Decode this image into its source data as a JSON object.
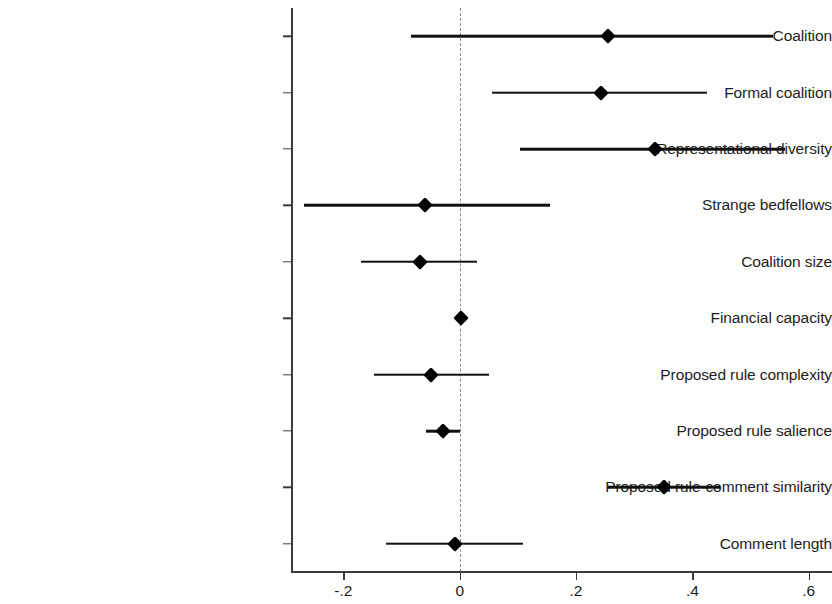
{
  "chart_data": {
    "type": "scatter",
    "subtype": "coefficient-plot",
    "title": "",
    "xlabel": "",
    "ylabel": "",
    "xlim": [
      -0.29,
      0.64
    ],
    "xticks": [
      -0.2,
      0,
      0.2,
      0.4,
      0.6
    ],
    "xtick_labels": [
      "-.2",
      "0",
      ".2",
      ".4",
      ".6"
    ],
    "grid": false,
    "legend": "none",
    "reference_line": {
      "value": 0,
      "style": "dashed",
      "color": "#8a8a8a"
    },
    "marker": {
      "shape": "diamond",
      "color": "#000000"
    },
    "ci_line_color": "#111111",
    "categories": [
      "Coalition",
      "Formal coalition",
      "Representational diversity",
      "Strange bedfellows",
      "Coalition size",
      "Financial capacity",
      "Proposed rule complexity",
      "Proposed rule salience",
      "Proposed rule-comment similarity",
      "Comment length"
    ],
    "points": [
      {
        "label": "Coalition",
        "estimate": 0.255,
        "ci_low": -0.084,
        "ci_high": 0.538
      },
      {
        "label": "Formal coalition",
        "estimate": 0.243,
        "ci_low": 0.055,
        "ci_high": 0.425
      },
      {
        "label": "Representational diversity",
        "estimate": 0.336,
        "ci_low": 0.104,
        "ci_high": 0.56
      },
      {
        "label": "Strange bedfellows",
        "estimate": -0.06,
        "ci_low": -0.267,
        "ci_high": 0.155
      },
      {
        "label": "Coalition size",
        "estimate": -0.069,
        "ci_low": -0.17,
        "ci_high": 0.03
      },
      {
        "label": "Financial capacity",
        "estimate": 0.002,
        "ci_low": -0.008,
        "ci_high": 0.012
      },
      {
        "label": "Proposed rule complexity",
        "estimate": -0.05,
        "ci_low": -0.147,
        "ci_high": 0.05
      },
      {
        "label": "Proposed rule salience",
        "estimate": -0.029,
        "ci_low": -0.058,
        "ci_high": 0.001
      },
      {
        "label": "Proposed rule-comment similarity",
        "estimate": 0.352,
        "ci_low": 0.255,
        "ci_high": 0.448
      },
      {
        "label": "Comment length",
        "estimate": -0.008,
        "ci_low": -0.126,
        "ci_high": 0.108
      }
    ]
  },
  "axes": {
    "x_tick_labels": [
      "-.2",
      "0",
      ".2",
      ".4",
      ".6"
    ]
  }
}
